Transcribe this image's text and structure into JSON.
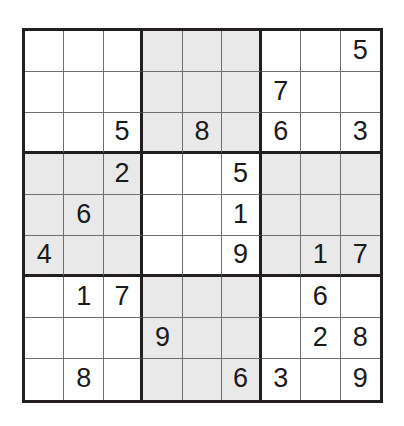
{
  "puzzle": {
    "type": "sudoku",
    "size": 9,
    "block_size": 3,
    "empty_marker": "",
    "colors": {
      "background": "#ffffff",
      "cell_white": "#ffffff",
      "cell_shaded": "#e9e9e9",
      "thin_line": "#6e6e6e",
      "thick_line": "#231f20",
      "digit": "#1a1a1a"
    },
    "shaded_blocks": [
      [
        0,
        1
      ],
      [
        1,
        0
      ],
      [
        1,
        2
      ],
      [
        2,
        1
      ]
    ],
    "rows": [
      [
        "",
        "",
        "",
        "",
        "",
        "",
        "",
        "",
        "5"
      ],
      [
        "",
        "",
        "",
        "",
        "",
        "",
        "7",
        "",
        ""
      ],
      [
        "",
        "",
        "5",
        "",
        "8",
        "",
        "6",
        "",
        "3"
      ],
      [
        "",
        "",
        "2",
        "",
        "",
        "5",
        "",
        "",
        ""
      ],
      [
        "",
        "6",
        "",
        "",
        "",
        "1",
        "",
        "",
        ""
      ],
      [
        "4",
        "",
        "",
        "",
        "",
        "9",
        "",
        "1",
        "7"
      ],
      [
        "",
        "1",
        "7",
        "",
        "",
        "",
        "",
        "6",
        ""
      ],
      [
        "",
        "",
        "",
        "9",
        "",
        "",
        "",
        "2",
        "8"
      ],
      [
        "",
        "8",
        "",
        "",
        "",
        "6",
        "3",
        "",
        "9"
      ]
    ]
  }
}
